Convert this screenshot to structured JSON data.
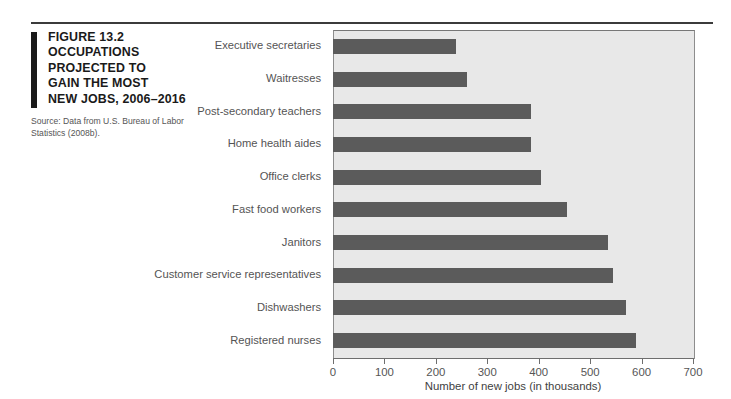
{
  "figure": {
    "label": "FIGURE 13.2",
    "title_lines": [
      "OCCUPATIONS",
      "PROJECTED TO",
      "GAIN THE MOST",
      "NEW JOBS, 2006–2016"
    ],
    "title_full": "FIGURE 13.2 OCCUPATIONS PROJECTED TO GAIN THE MOST NEW JOBS, 2006–2016",
    "source": "Source: Data from U.S. Bureau of Labor Statistics (2008b)."
  },
  "colors": {
    "bar": "#5b5b5b",
    "plot_background": "#e8e8e8",
    "plot_border": "#8d8d8d",
    "rule": "#3b3b3b",
    "caption_bar": "#1a1a1a",
    "label_text": "#545454"
  },
  "chart_data": {
    "type": "bar",
    "orientation": "horizontal",
    "title": "OCCUPATIONS PROJECTED TO GAIN THE MOST NEW JOBS, 2006–2016",
    "subtitle": "",
    "xlabel": "Number of new jobs (in thousands)",
    "ylabel": "",
    "xlim": [
      0,
      700
    ],
    "ylim": null,
    "grid": false,
    "legend": null,
    "xticks": [
      0,
      100,
      200,
      300,
      400,
      500,
      600,
      700
    ],
    "xtick_labels": [
      "0",
      "100",
      "200",
      "300",
      "400",
      "500",
      "600",
      "700"
    ],
    "categories": [
      "Executive secretaries",
      "Waitresses",
      "Post-secondary teachers",
      "Home health aides",
      "Office clerks",
      "Fast food workers",
      "Janitors",
      "Customer service representatives",
      "Dishwashers",
      "Registered nurses"
    ],
    "values": [
      240,
      260,
      385,
      385,
      405,
      455,
      535,
      545,
      570,
      590
    ],
    "series": [
      {
        "name": "Number of new jobs (in thousands)",
        "values": [
          240,
          260,
          385,
          385,
          405,
          455,
          535,
          545,
          570,
          590
        ]
      }
    ]
  }
}
